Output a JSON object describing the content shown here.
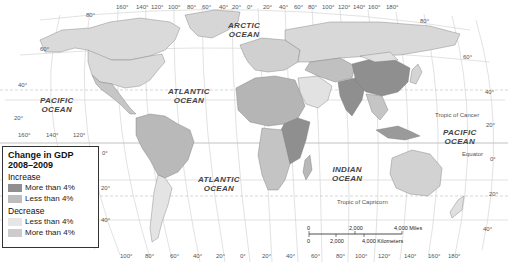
{
  "map": {
    "title": "Change in GDP 2008–2009",
    "type": "choropleth world map",
    "colors": {
      "land_default": "#d8d8d8",
      "increase_more_4": "#8f8f8f",
      "increase_less_4": "#b9b9b9",
      "decrease_less_4": "#e8e8e8",
      "decrease_more_4": "#c8c8c8",
      "ocean": "#ffffff",
      "grid": "#c9c9c9",
      "border": "#6e6e6e"
    }
  },
  "legend": {
    "title_line1": "Change in GDP",
    "title_line2": "2008–2009",
    "groups": [
      {
        "label": "Increase",
        "items": [
          {
            "label": "More than 4%",
            "color": "#8f8f8f"
          },
          {
            "label": "Less than 4%",
            "color": "#bdbdbd"
          }
        ]
      },
      {
        "label": "Decrease",
        "items": [
          {
            "label": "Less than 4%",
            "color": "#e6e6e6"
          },
          {
            "label": "More than 4%",
            "color": "#cccccc"
          }
        ]
      }
    ]
  },
  "oceans": [
    {
      "name_line1": "ARCTIC",
      "name_line2": "OCEAN"
    },
    {
      "name_line1": "PACIFIC",
      "name_line2": "OCEAN"
    },
    {
      "name_line1": "ATLANTIC",
      "name_line2": "OCEAN"
    },
    {
      "name_line1": "ATLANTIC",
      "name_line2": "OCEAN"
    },
    {
      "name_line1": "INDIAN",
      "name_line2": "OCEAN"
    },
    {
      "name_line1": "PACIFIC",
      "name_line2": "OCEAN"
    }
  ],
  "reference_lines": {
    "tropic_cancer": "Tropic of Cancer",
    "equator": "Equator",
    "tropic_capricorn": "Tropic of Capricorn"
  },
  "top_longitudes": [
    "160°",
    "140°",
    "120°",
    "100°",
    "80°",
    "60°",
    "40°",
    "20°",
    "0°",
    "20°",
    "40°",
    "60°",
    "80°",
    "100°",
    "120°",
    "140°",
    "160°",
    "180°"
  ],
  "bottom_longitudes": [
    "100°",
    "80°",
    "60°",
    "40°",
    "20°",
    "0°",
    "20°",
    "40°",
    "60°",
    "80°",
    "100°",
    "120°",
    "140°",
    "160°",
    "180°"
  ],
  "left_longitudes": [
    "160°",
    "140°",
    "120°"
  ],
  "latitudes_left": [
    "80°",
    "60°",
    "40°",
    "20°",
    "0°",
    "20°",
    "40°"
  ],
  "latitudes_right": [
    "80°",
    "60°",
    "40°",
    "20°",
    "0°",
    "20°",
    "40°"
  ],
  "scale": {
    "miles_0": "0",
    "miles_mid": "2,000",
    "miles_max": "4,000 Miles",
    "km_0": "0",
    "km_mid": "2,000",
    "km_max": "4,000 Kilometers"
  }
}
